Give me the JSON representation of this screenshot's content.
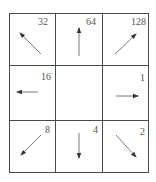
{
  "diagram": {
    "grid": {
      "rows": 3,
      "cols": 3
    },
    "line_color": "#4a4a4a",
    "arrow_color": "#5a5a5a",
    "cells": [
      {
        "row": 0,
        "col": 0,
        "code": "32",
        "direction": "northwest"
      },
      {
        "row": 0,
        "col": 1,
        "code": "64",
        "direction": "north"
      },
      {
        "row": 0,
        "col": 2,
        "code": "128",
        "direction": "northeast"
      },
      {
        "row": 1,
        "col": 0,
        "code": "16",
        "direction": "west"
      },
      {
        "row": 1,
        "col": 1,
        "code": "",
        "direction": "center"
      },
      {
        "row": 1,
        "col": 2,
        "code": "1",
        "direction": "east"
      },
      {
        "row": 2,
        "col": 0,
        "code": "8",
        "direction": "southwest"
      },
      {
        "row": 2,
        "col": 1,
        "code": "4",
        "direction": "south"
      },
      {
        "row": 2,
        "col": 2,
        "code": "2",
        "direction": "southeast"
      }
    ]
  }
}
